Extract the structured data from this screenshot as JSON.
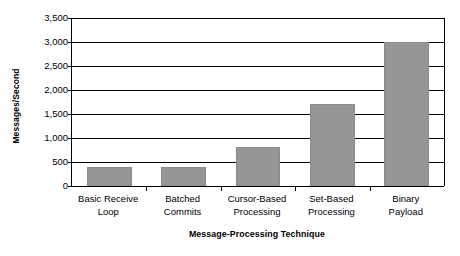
{
  "chart_data": {
    "type": "bar",
    "title": "",
    "subtitle": "",
    "xlabel": "Message-Processing Technique",
    "ylabel": "Messages/Second",
    "categories": [
      "Basic Receive\nLoop",
      "Batched\nCommits",
      "Cursor-Based\nProcessing",
      "Set-Based\nProcessing",
      "Binary\nPayload"
    ],
    "values": [
      400,
      400,
      810,
      1700,
      3000
    ],
    "ylim": [
      0,
      3500
    ],
    "ytick_labels": [
      "0",
      "500",
      "1,000",
      "1,500",
      "2,000",
      "2,500",
      "3,000",
      "3,500"
    ],
    "ytick_values": [
      0,
      500,
      1000,
      1500,
      2000,
      2500,
      3000,
      3500
    ],
    "grid": true,
    "legend": false,
    "legend_position": "none",
    "bar_color": "#969696",
    "axis_color": "#000000",
    "background_color": "#ffffff"
  }
}
